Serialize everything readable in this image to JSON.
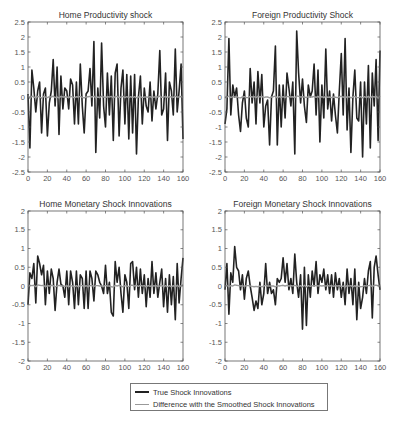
{
  "legend": {
    "items": [
      {
        "label": "True Shock Innovations",
        "color": "#222222"
      },
      {
        "label": "Difference with the Smoothed Shock Innovations",
        "color": "#999999"
      }
    ]
  },
  "chart_data": [
    {
      "type": "line",
      "title": "Home Productivity shock",
      "xlabel": "",
      "ylabel": "",
      "xlim": [
        0,
        160
      ],
      "ylim": [
        -2.5,
        2.5
      ],
      "xticks": [
        0,
        20,
        40,
        60,
        80,
        100,
        120,
        140,
        160
      ],
      "yticks": [
        -2.5,
        -2,
        -1.5,
        -1,
        -0.5,
        0,
        0.5,
        1,
        1.5,
        2,
        2.5
      ],
      "grid": false,
      "x_step": 2,
      "series": [
        {
          "name": "True Shock Innovations",
          "values": [
            0.1,
            -1.7,
            0.9,
            0.3,
            -0.5,
            0.2,
            0.5,
            -1.2,
            0.1,
            0.3,
            -1.3,
            -0.2,
            0.2,
            1.25,
            -0.3,
            1.0,
            -1.25,
            0.7,
            -0.4,
            0.3,
            0.2,
            -0.4,
            0.6,
            0.4,
            -0.9,
            0.5,
            -0.9,
            1.1,
            -0.3,
            -1.2,
            0.1,
            0.2,
            0.95,
            -0.3,
            1.85,
            -1.85,
            0.3,
            -0.7,
            1.8,
            -0.3,
            -1.0,
            0.8,
            -0.6,
            0.7,
            -1.45,
            0.8,
            1.1,
            -1.3,
            0.3,
            0.9,
            -0.9,
            0.75,
            -1.4,
            0.7,
            -1.2,
            0.75,
            -1.9,
            0.0,
            0.7,
            -0.9,
            0.3,
            -0.3,
            -0.5,
            0.5,
            -0.8,
            0.2,
            -0.4,
            0.1,
            1.55,
            -0.6,
            -0.4,
            0.8,
            -1.45,
            0.5,
            0.2,
            -0.6,
            1.6,
            -0.5,
            0.2,
            1.1,
            -1.4
          ]
        },
        {
          "name": "Difference with the Smoothed Shock Innovations",
          "values": [
            0.05,
            -0.05,
            0.03,
            0.0,
            -0.03,
            0.02,
            0.0,
            -0.04,
            0.02,
            0.0,
            -0.02,
            0.01,
            0.0,
            0.03,
            -0.02,
            0.0,
            -0.03,
            0.02,
            0.0,
            0.01,
            0.0,
            -0.02,
            0.02,
            0.0,
            -0.03,
            0.01,
            0.0,
            0.02,
            -0.01,
            -0.03,
            0.0,
            0.01,
            0.02,
            0.0,
            0.03,
            -0.03,
            0.0,
            -0.02,
            0.03,
            0.0,
            -0.02,
            0.01,
            0.0,
            0.02,
            -0.03,
            0.01,
            0.02,
            -0.02,
            0.0,
            0.02,
            -0.02,
            0.01,
            -0.02,
            0.01,
            -0.02,
            0.01,
            -0.03,
            0.0,
            0.01,
            -0.02,
            0.0,
            0.0,
            -0.01,
            0.01,
            -0.02,
            0.0,
            0.0,
            0.0,
            0.03,
            -0.01,
            0.0,
            0.02,
            -0.02,
            0.01,
            0.0,
            -0.01,
            0.03,
            0.0,
            0.0,
            0.02,
            -0.02
          ]
        }
      ]
    },
    {
      "type": "line",
      "title": "Foreign Productivity Shock",
      "xlabel": "",
      "ylabel": "",
      "xlim": [
        0,
        160
      ],
      "ylim": [
        -2.5,
        2.5
      ],
      "xticks": [
        0,
        20,
        40,
        60,
        80,
        100,
        120,
        140,
        160
      ],
      "yticks": [
        -2.5,
        -2,
        -1.5,
        -1,
        -0.5,
        0,
        0.5,
        1,
        1.5,
        2,
        2.5
      ],
      "grid": false,
      "x_step": 2,
      "series": [
        {
          "name": "True Shock Innovations",
          "values": [
            -0.9,
            -0.4,
            1.95,
            -0.6,
            0.4,
            0.0,
            0.3,
            -0.6,
            -1.15,
            -0.2,
            0.2,
            -0.7,
            -1.0,
            0.95,
            -0.2,
            0.5,
            -0.9,
            0.85,
            -0.2,
            0.75,
            -1.0,
            -0.3,
            -0.1,
            -1.6,
            0.0,
            0.2,
            1.7,
            -1.6,
            0.4,
            -1.0,
            0.4,
            -0.7,
            0.8,
            0.3,
            -0.3,
            0.5,
            -1.9,
            2.2,
            0.8,
            -0.2,
            0.6,
            -0.3,
            -0.85,
            0.4,
            0.0,
            0.2,
            1.1,
            -0.6,
            0.9,
            -1.5,
            0.4,
            -0.7,
            1.6,
            -0.4,
            0.2,
            -0.8,
            0.1,
            -0.6,
            -1.2,
            0.2,
            1.45,
            -0.6,
            1.95,
            -1.1,
            0.3,
            -1.85,
            0.0,
            0.9,
            -0.7,
            -0.8,
            0.5,
            -2.0,
            0.5,
            -0.9,
            1.05,
            -1.7,
            0.8,
            -0.3,
            1.25,
            -1.45,
            1.55
          ]
        },
        {
          "name": "Difference with the Smoothed Shock Innovations",
          "values": [
            -0.03,
            0.0,
            0.03,
            -0.02,
            0.01,
            0.0,
            0.01,
            -0.02,
            -0.03,
            0.0,
            0.01,
            -0.02,
            -0.02,
            0.02,
            0.0,
            0.01,
            -0.02,
            0.02,
            0.0,
            0.02,
            -0.02,
            0.0,
            0.0,
            -0.03,
            0.0,
            0.01,
            0.03,
            -0.03,
            0.01,
            -0.02,
            0.01,
            -0.02,
            0.02,
            0.01,
            0.0,
            0.01,
            -0.03,
            0.04,
            0.02,
            0.0,
            0.01,
            0.0,
            -0.02,
            0.01,
            0.0,
            0.0,
            0.02,
            -0.01,
            0.02,
            -0.03,
            0.01,
            -0.02,
            0.03,
            -0.01,
            0.0,
            -0.02,
            0.0,
            -0.01,
            -0.02,
            0.0,
            0.03,
            -0.01,
            0.03,
            -0.02,
            0.01,
            -0.03,
            0.0,
            0.02,
            -0.02,
            -0.02,
            0.01,
            -0.03,
            0.01,
            -0.02,
            0.02,
            -0.03,
            0.02,
            0.0,
            0.02,
            -0.03,
            0.03
          ]
        }
      ]
    },
    {
      "type": "line",
      "title": "Home Monetary Shock Innovations",
      "xlabel": "",
      "ylabel": "",
      "xlim": [
        0,
        160
      ],
      "ylim": [
        -2,
        2
      ],
      "xticks": [
        0,
        20,
        40,
        60,
        80,
        100,
        120,
        140,
        160
      ],
      "yticks": [
        -2,
        -1.5,
        -1,
        -0.5,
        0,
        0.5,
        1,
        1.5,
        2
      ],
      "grid": false,
      "x_step": 2,
      "series": [
        {
          "name": "True Shock Innovations",
          "values": [
            -0.5,
            0.35,
            0.2,
            0.6,
            -0.45,
            0.8,
            0.6,
            0.3,
            0.55,
            -0.5,
            0.4,
            -0.2,
            0.45,
            0.2,
            -0.65,
            0.1,
            0.45,
            0.05,
            0.0,
            -0.3,
            0.4,
            -0.5,
            0.4,
            0.1,
            -0.6,
            0.4,
            -0.5,
            0.3,
            0.2,
            -0.6,
            0.4,
            -0.6,
            0.4,
            0.2,
            -0.4,
            0.4,
            0.3,
            0.1,
            0.0,
            -0.2,
            0.55,
            -0.2,
            0.1,
            -0.7,
            -0.8,
            0.65,
            0.1,
            0.5,
            -0.2,
            -0.7,
            0.3,
            0.1,
            -0.6,
            0.6,
            0.65,
            -0.1,
            0.5,
            -0.3,
            0.45,
            -0.2,
            0.3,
            -0.55,
            0.2,
            -0.3,
            0.65,
            -0.2,
            0.35,
            -0.3,
            0.1,
            0.45,
            -0.55,
            0.2,
            -0.7,
            0.3,
            -0.5,
            0.25,
            -0.9,
            0.6,
            -0.45,
            0.2,
            0.75
          ]
        },
        {
          "name": "Difference with the Smoothed Shock Innovations",
          "values": [
            -0.02,
            0.02,
            0.01,
            0.02,
            -0.02,
            0.03,
            0.02,
            0.01,
            0.02,
            -0.02,
            0.01,
            0.0,
            0.02,
            0.01,
            -0.02,
            0.0,
            0.02,
            0.0,
            0.0,
            -0.01,
            0.01,
            -0.02,
            0.01,
            0.0,
            -0.02,
            0.01,
            -0.02,
            0.01,
            0.01,
            -0.02,
            0.01,
            -0.02,
            0.01,
            0.01,
            -0.01,
            0.01,
            0.01,
            0.0,
            0.0,
            -0.01,
            0.02,
            0.0,
            0.0,
            -0.02,
            -0.03,
            0.02,
            0.0,
            0.02,
            0.0,
            -0.02,
            0.01,
            0.0,
            -0.02,
            0.02,
            0.02,
            0.0,
            0.02,
            -0.01,
            0.02,
            0.0,
            0.01,
            -0.02,
            0.01,
            -0.01,
            0.02,
            0.0,
            0.01,
            -0.01,
            0.0,
            0.02,
            -0.02,
            0.01,
            -0.02,
            0.01,
            -0.02,
            0.01,
            -0.03,
            0.02,
            -0.02,
            0.01,
            0.03
          ]
        }
      ]
    },
    {
      "type": "line",
      "title": "Foreign Monetary Shock Innovations",
      "xlabel": "",
      "ylabel": "",
      "xlim": [
        0,
        160
      ],
      "ylim": [
        -2,
        2
      ],
      "xticks": [
        0,
        20,
        40,
        60,
        80,
        100,
        120,
        140,
        160
      ],
      "yticks": [
        -2,
        -1.5,
        -1,
        -0.5,
        0,
        0.5,
        1,
        1.5,
        2
      ],
      "grid": false,
      "x_step": 2,
      "series": [
        {
          "name": "True Shock Innovations",
          "values": [
            -0.1,
            0.6,
            -0.75,
            0.35,
            0.1,
            1.05,
            0.5,
            0.4,
            -0.1,
            0.3,
            -0.35,
            0.2,
            0.4,
            0.0,
            -0.3,
            -0.65,
            -0.4,
            -0.6,
            0.1,
            -0.5,
            -0.2,
            0.6,
            -0.2,
            0.1,
            -0.2,
            -0.1,
            -0.5,
            0.2,
            0.1,
            0.2,
            0.75,
            0.1,
            0.6,
            -0.1,
            0.2,
            -0.2,
            0.85,
            0.1,
            -0.3,
            0.3,
            -1.15,
            0.5,
            -1.05,
            0.3,
            -0.3,
            0.4,
            0.0,
            0.65,
            -0.2,
            0.3,
            0.1,
            0.45,
            -0.1,
            0.3,
            -0.2,
            0.3,
            -0.3,
            0.35,
            -0.1,
            0.2,
            -0.3,
            0.1,
            -0.5,
            0.45,
            -0.2,
            0.2,
            -0.5,
            0.45,
            -0.9,
            0.1,
            -0.6,
            -0.3,
            0.2,
            -0.2,
            0.4,
            0.65,
            -0.85,
            0.5,
            0.8,
            0.3,
            -0.1
          ]
        },
        {
          "name": "Difference with the Smoothed Shock Innovations",
          "values": [
            0.0,
            0.02,
            -0.02,
            0.01,
            0.0,
            0.03,
            0.02,
            0.01,
            0.0,
            0.01,
            -0.01,
            0.01,
            0.01,
            0.0,
            -0.01,
            -0.02,
            -0.01,
            -0.02,
            0.0,
            -0.02,
            0.0,
            0.02,
            0.0,
            0.0,
            0.0,
            0.0,
            -0.02,
            0.01,
            0.0,
            0.01,
            0.02,
            0.0,
            0.02,
            0.0,
            0.01,
            0.0,
            0.02,
            0.0,
            -0.01,
            0.01,
            -0.03,
            0.02,
            -0.03,
            0.01,
            -0.01,
            0.01,
            0.0,
            0.02,
            0.0,
            0.01,
            0.0,
            0.01,
            0.0,
            0.01,
            0.0,
            0.01,
            -0.01,
            0.01,
            0.0,
            0.01,
            -0.01,
            0.0,
            -0.02,
            0.01,
            0.0,
            0.01,
            -0.02,
            0.01,
            -0.03,
            0.0,
            -0.02,
            -0.01,
            0.01,
            0.0,
            0.01,
            0.02,
            -0.02,
            0.02,
            0.02,
            0.01,
            0.0
          ]
        }
      ]
    }
  ]
}
